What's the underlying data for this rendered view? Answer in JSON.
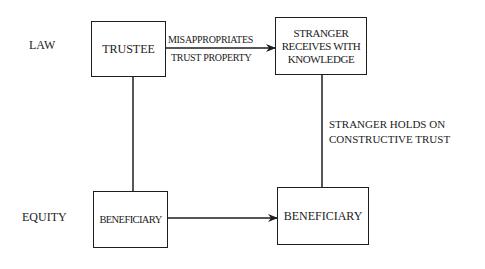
{
  "rows": {
    "law": "LAW",
    "equity": "EQUITY"
  },
  "boxes": {
    "trustee": "TRUSTEE",
    "stranger": [
      "STRANGER",
      "RECEIVES WITH",
      "KNOWLEDGE"
    ],
    "beneficiary_left": "BENEFICIARY",
    "beneficiary_right": "BENEFICIARY"
  },
  "arrows": {
    "top_label_above": "MISAPPROPRIATES",
    "top_label_below": "TRUST PROPERTY"
  },
  "annotations": {
    "right_line": [
      "STRANGER HOLDS ON",
      "CONSTRUCTIVE TRUST"
    ]
  },
  "colors": {
    "stroke": "#1e1e1e",
    "text": "#222222",
    "background": "#ffffff"
  }
}
